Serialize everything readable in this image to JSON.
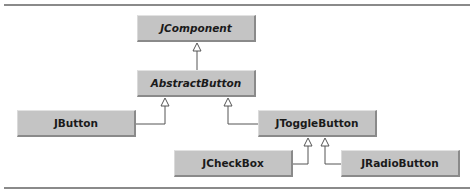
{
  "diagram": {
    "type": "uml-class-hierarchy",
    "classes": [
      {
        "id": "jcomponent",
        "label": "JComponent",
        "abstract": true
      },
      {
        "id": "abstractbutton",
        "label": "AbstractButton",
        "abstract": true
      },
      {
        "id": "jbutton",
        "label": "JButton",
        "abstract": false
      },
      {
        "id": "jtogglebutton",
        "label": "JToggleButton",
        "abstract": false
      },
      {
        "id": "jcheckbox",
        "label": "JCheckBox",
        "abstract": false
      },
      {
        "id": "jradiobutton",
        "label": "JRadioButton",
        "abstract": false
      }
    ],
    "inheritance": [
      {
        "child": "AbstractButton",
        "parent": "JComponent"
      },
      {
        "child": "JButton",
        "parent": "AbstractButton"
      },
      {
        "child": "JToggleButton",
        "parent": "AbstractButton"
      },
      {
        "child": "JCheckBox",
        "parent": "JToggleButton"
      },
      {
        "child": "JRadioButton",
        "parent": "JToggleButton"
      }
    ],
    "colors": {
      "box_fill": "#c4c4c4",
      "box_shadow": "#8a8a8a",
      "line": "#555555",
      "rule": "#8a8a8a"
    }
  }
}
